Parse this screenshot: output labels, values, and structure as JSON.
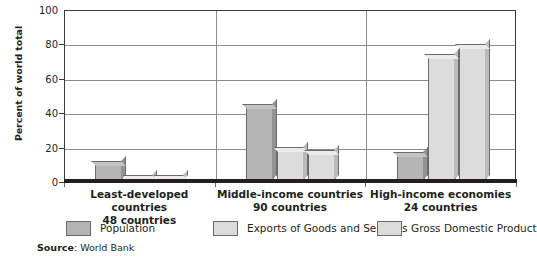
{
  "chart_data": {
    "type": "bar",
    "title": "",
    "xlabel": "",
    "ylabel": "Percent of world total",
    "ylim": [
      0,
      100
    ],
    "yticks": [
      0,
      20,
      40,
      60,
      80,
      100
    ],
    "grid": true,
    "legend_position": "bottom",
    "categories": [
      "Least-developed countries 48 countries",
      "Middle-income countries 90 countries",
      "High-income economies 24 countries"
    ],
    "category_lines": [
      {
        "line1": "Least-developed countries",
        "line2": "48 countries"
      },
      {
        "line1": "Middle-income countries",
        "line2": "90 countries"
      },
      {
        "line1": "High-income economies",
        "line2": "24 countries"
      }
    ],
    "series": [
      {
        "name": "Population",
        "color": "#b4b4b4",
        "values": [
          10,
          43,
          15
        ]
      },
      {
        "name": "Exports of Goods and Services",
        "color": "#dcdcdc",
        "values": [
          1.5,
          18,
          72
        ]
      },
      {
        "name": "Gross Domestic Product",
        "color": "#dcdcdc",
        "values": [
          1.5,
          16,
          78
        ]
      }
    ],
    "source": {
      "label": "Source",
      "separator": ": ",
      "value": "World Bank"
    }
  },
  "axis": {
    "y_title": "Percent of world total",
    "y_tick_labels": [
      "100",
      "80",
      "60",
      "40",
      "20",
      "0"
    ]
  },
  "legend": {
    "items": [
      {
        "label": "Population"
      },
      {
        "label": "Exports of Goods and Services"
      },
      {
        "label": "Gross Domestic Product"
      }
    ]
  },
  "groups": [
    {
      "line1": "Least-developed countries",
      "line2": "48 countries"
    },
    {
      "line1": "Middle-income countries",
      "line2": "90 countries"
    },
    {
      "line1": "High-income economies",
      "line2": "24 countries"
    }
  ],
  "source_line": {
    "label": "Source",
    "separator": ": ",
    "value": "World Bank"
  },
  "colors": {
    "population": "#b4b4b4",
    "exports": "#dcdcdc",
    "gdp": "#dcdcdc",
    "axis": "#231f20",
    "grid": "#8c8c8c"
  }
}
